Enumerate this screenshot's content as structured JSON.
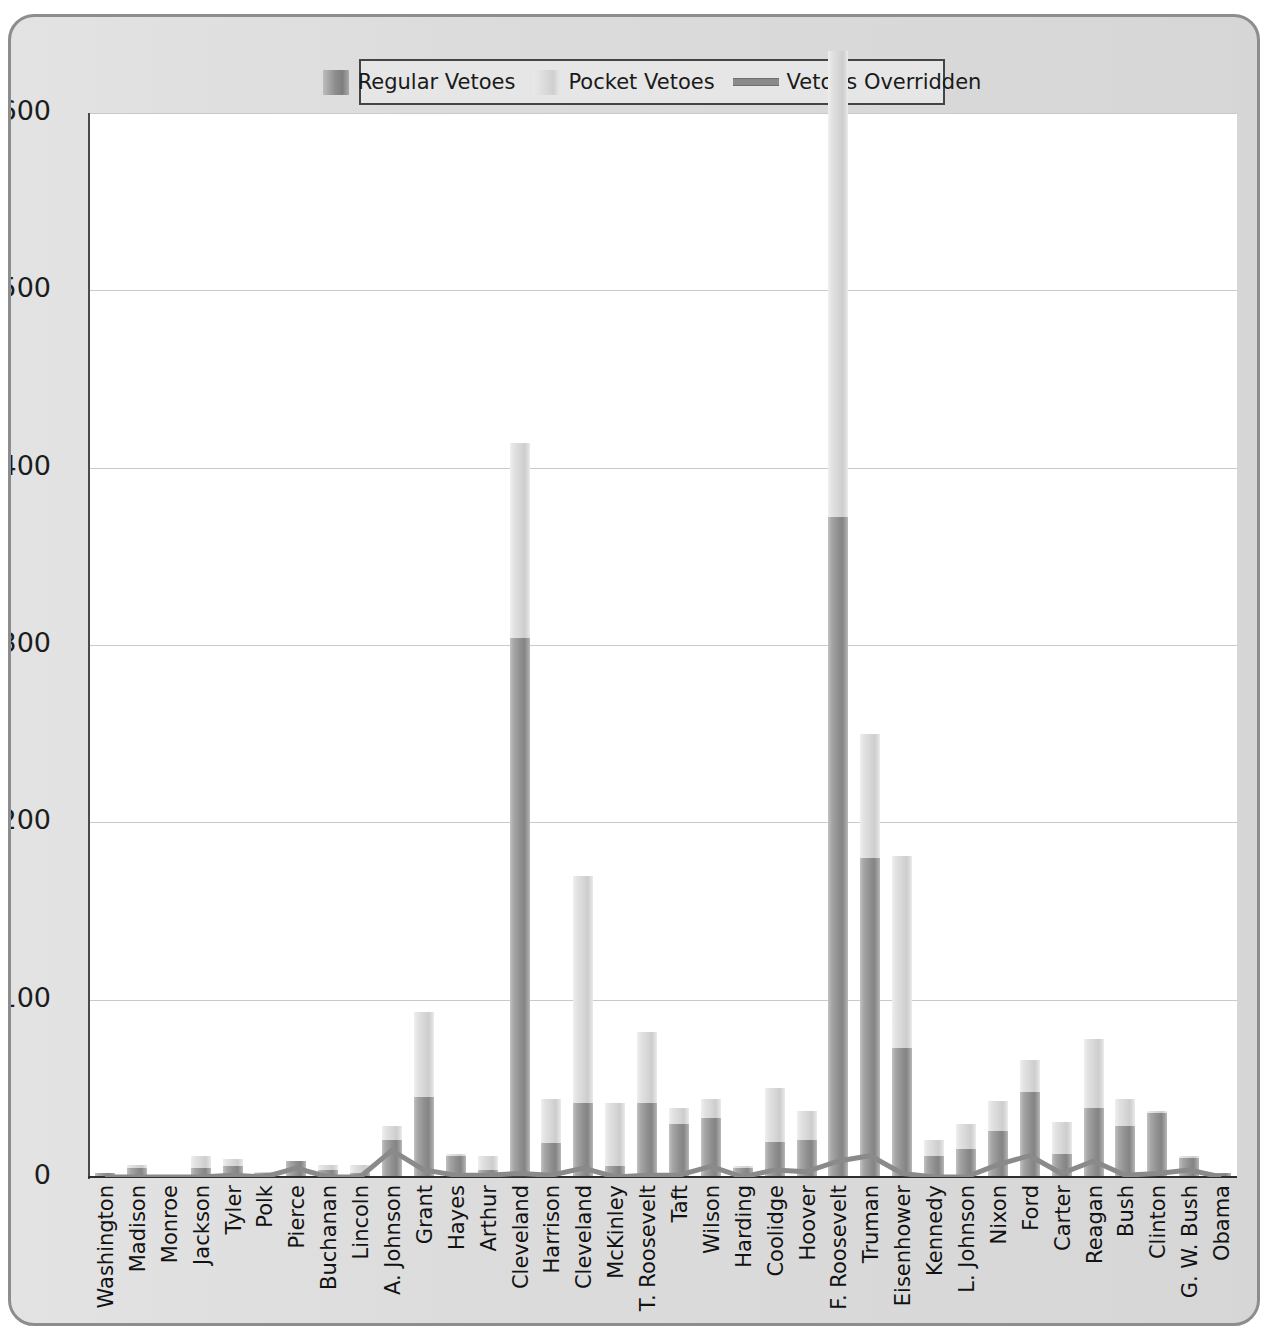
{
  "legend": {
    "items": [
      {
        "label": "Regular Vetoes",
        "marker": "swatch",
        "color": "#909090"
      },
      {
        "label": "Pocket Vetoes",
        "marker": "swatch",
        "color": "#d6d6d6"
      },
      {
        "label": "Vetoes Overridden",
        "marker": "line",
        "color": "#8a8a8a"
      }
    ]
  },
  "axis": {
    "y_ticks": [
      "0",
      "100",
      "200",
      "300",
      "400",
      "500",
      "600"
    ]
  },
  "chart_data": {
    "type": "bar",
    "subtype": "stacked-bar-with-line-overlay",
    "title": "",
    "subtitle": "",
    "xlabel": "",
    "ylabel": "",
    "ylim": [
      0,
      600
    ],
    "grid": true,
    "legend_position": "top-center",
    "categories": [
      "Washington",
      "Madison",
      "Monroe",
      "Jackson",
      "Tyler",
      "Polk",
      "Pierce",
      "Buchanan",
      "Lincoln",
      "A. Johnson",
      "Grant",
      "Hayes",
      "Arthur",
      "Cleveland",
      "Harrison",
      "Cleveland",
      "McKinley",
      "T. Roosevelt",
      "Taft",
      "Wilson",
      "Harding",
      "Coolidge",
      "Hoover",
      "F. Roosevelt",
      "Truman",
      "Eisenhower",
      "Kennedy",
      "L. Johnson",
      "Nixon",
      "Ford",
      "Carter",
      "Reagan",
      "Bush",
      "Clinton",
      "G. W. Bush",
      "Obama"
    ],
    "series": [
      {
        "name": "Regular Vetoes",
        "type": "bar",
        "color": "#909090",
        "values": [
          2,
          5,
          1,
          5,
          6,
          2,
          9,
          4,
          2,
          21,
          45,
          12,
          4,
          304,
          19,
          42,
          6,
          42,
          30,
          33,
          5,
          20,
          21,
          372,
          180,
          73,
          12,
          16,
          26,
          48,
          13,
          39,
          29,
          36,
          11,
          2
        ]
      },
      {
        "name": "Pocket Vetoes",
        "type": "bar",
        "color": "#d6d6d6",
        "values": [
          0,
          2,
          0,
          7,
          4,
          1,
          0,
          3,
          5,
          8,
          48,
          1,
          8,
          110,
          25,
          128,
          36,
          40,
          9,
          11,
          1,
          30,
          16,
          263,
          70,
          108,
          9,
          14,
          17,
          18,
          18,
          39,
          15,
          1,
          1,
          0
        ]
      },
      {
        "name": "Vetoes Overridden",
        "type": "line",
        "color": "#8a8a8a",
        "values": [
          0,
          0,
          0,
          0,
          1,
          0,
          5,
          0,
          0,
          15,
          4,
          1,
          1,
          2,
          1,
          5,
          0,
          1,
          1,
          6,
          0,
          4,
          3,
          9,
          12,
          2,
          0,
          0,
          7,
          12,
          2,
          9,
          1,
          2,
          4,
          0
        ]
      }
    ]
  }
}
